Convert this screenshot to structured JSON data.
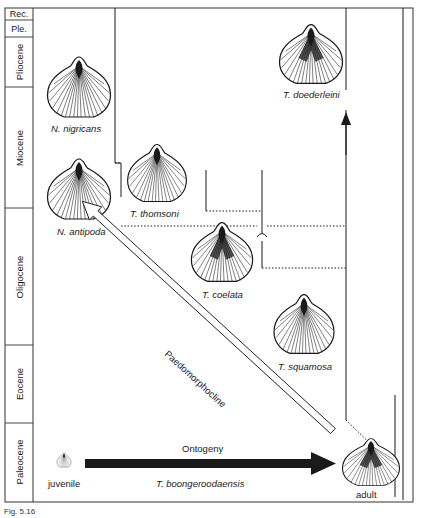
{
  "figure": {
    "caption_fragment": "Fig. 5.16",
    "epochs": [
      {
        "name": "Rec.",
        "y_top": 8,
        "y_bottom": 20,
        "orientation": "horizontal"
      },
      {
        "name": "Ple.",
        "y_top": 20,
        "y_bottom": 37,
        "orientation": "horizontal"
      },
      {
        "name": "Pliocene",
        "y_top": 37,
        "y_bottom": 87,
        "orientation": "vertical"
      },
      {
        "name": "Miocene",
        "y_top": 87,
        "y_bottom": 208,
        "orientation": "vertical"
      },
      {
        "name": "Oligocene",
        "y_top": 208,
        "y_bottom": 345,
        "orientation": "vertical"
      },
      {
        "name": "Eocene",
        "y_top": 345,
        "y_bottom": 423,
        "orientation": "vertical"
      },
      {
        "name": "Paleocene",
        "y_top": 423,
        "y_bottom": 502,
        "orientation": "vertical"
      }
    ],
    "species": {
      "n_nigricans": "N. nigricans",
      "n_antipoda": "N. antipoda",
      "t_thomsoni": "T. thomsoni",
      "t_coelata": "T. coelata",
      "t_squamosa": "T. squamosa",
      "t_doederleini": "T. doederleini",
      "t_boongeroodaensis": "T. boongeroodaensis"
    },
    "labels": {
      "juvenile": "juvenile",
      "adult": "adult",
      "ontogeny": "Ontogeny",
      "paedomorphocline": "Paedomorphocline"
    },
    "colors": {
      "ink": "#1a1a1a",
      "background": "#ffffff",
      "frame": "#333333"
    }
  }
}
